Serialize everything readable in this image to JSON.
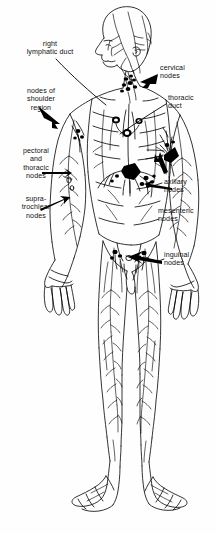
{
  "figure": {
    "background_color": "#fefefe",
    "ink_color": "#000000",
    "width": 216,
    "height": 533
  },
  "labels": [
    {
      "id": "right-lymphatic-duct",
      "text": "right\nlymphatic duct",
      "x": 14,
      "y": 42,
      "align": "center-align",
      "pointer": "line"
    },
    {
      "id": "nodes-of-shoulder-region",
      "text": "nodes of\nshoulder\nregion",
      "x": 12,
      "y": 89,
      "align": "center-align",
      "pointer": "arrow"
    },
    {
      "id": "pectoral-and-thoracic-nodes",
      "text": "pectoral\nand\nthoracic\nnodes",
      "x": 8,
      "y": 148,
      "align": "center-align",
      "pointer": "arrow"
    },
    {
      "id": "supra-trochlear-nodes",
      "text": "supra-\ntrochlear\nnodes",
      "x": 8,
      "y": 196,
      "align": "center-align",
      "pointer": "arrow"
    },
    {
      "id": "cervical-nodes",
      "text": "cervical\nnodes",
      "x": 160,
      "y": 66,
      "align": "left-align",
      "pointer": "arrow"
    },
    {
      "id": "thoracic-duct",
      "text": "thoracic\nduct",
      "x": 168,
      "y": 96,
      "align": "left-align",
      "pointer": "line"
    },
    {
      "id": "axillary-nodes",
      "text": "axillary\nnodes",
      "x": 164,
      "y": 180,
      "align": "left-align",
      "pointer": "arrow"
    },
    {
      "id": "mesenteric-nodes",
      "text": "mesenteric\nnodes",
      "x": 160,
      "y": 209,
      "align": "left-align",
      "pointer": "arrow"
    },
    {
      "id": "inguinal-nodes",
      "text": "inguinal\nnodes",
      "x": 166,
      "y": 253,
      "align": "left-align",
      "pointer": "arrow"
    }
  ]
}
